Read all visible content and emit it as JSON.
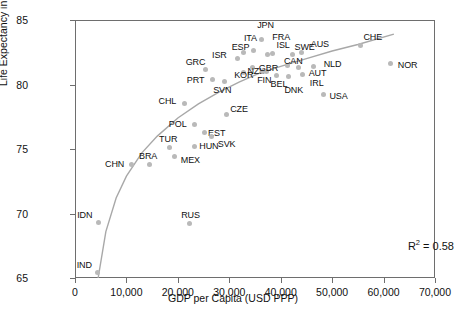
{
  "chart_data": {
    "type": "scatter",
    "title": "",
    "xlabel": "GDP per Capita (USD PPP)",
    "ylabel": "Life Expectancy in Years",
    "xlim": [
      0,
      70000
    ],
    "ylim": [
      65,
      85
    ],
    "xticks": [
      "0",
      "10,000",
      "20,000",
      "30,000",
      "40,000",
      "50,000",
      "60,000",
      "70,000"
    ],
    "xtick_values": [
      0,
      10000,
      20000,
      30000,
      40000,
      50000,
      60000,
      70000
    ],
    "yticks": [
      "65",
      "70",
      "75",
      "80",
      "85"
    ],
    "ytick_values": [
      65,
      70,
      75,
      80,
      85
    ],
    "grid": false,
    "legend": "none",
    "annotation": "R2 = 0.58",
    "annotation_r2": "0.58",
    "trendline": {
      "type": "logarithmic",
      "color": "#a8a8a8",
      "points": [
        [
          4500,
          65.0
        ],
        [
          6000,
          68.6
        ],
        [
          8000,
          71.2
        ],
        [
          10000,
          72.9
        ],
        [
          13000,
          74.7
        ],
        [
          16000,
          76.0
        ],
        [
          20000,
          77.4
        ],
        [
          24000,
          78.5
        ],
        [
          28000,
          79.4
        ],
        [
          32000,
          80.2
        ],
        [
          36000,
          80.9
        ],
        [
          40000,
          81.4
        ],
        [
          45000,
          82.0
        ],
        [
          50000,
          82.6
        ],
        [
          55000,
          83.1
        ],
        [
          62000,
          83.9
        ]
      ]
    },
    "marker_color": "#b9b9b9",
    "points": [
      {
        "label": "IND",
        "x": 4400,
        "y": 65.4,
        "lx": -21,
        "ly": -12
      },
      {
        "label": "IDN",
        "x": 4500,
        "y": 69.3,
        "lx": -21,
        "ly": -12
      },
      {
        "label": "CHN",
        "x": 10900,
        "y": 73.8,
        "lx": -26,
        "ly": -4
      },
      {
        "label": "BRA",
        "x": 14400,
        "y": 73.8,
        "lx": -10,
        "ly": -12
      },
      {
        "label": "TUR",
        "x": 18300,
        "y": 75.1,
        "lx": -10,
        "ly": -13
      },
      {
        "label": "MEX",
        "x": 19400,
        "y": 74.4,
        "lx": 6,
        "ly": -1
      },
      {
        "label": "RUS",
        "x": 22200,
        "y": 69.2,
        "lx": -8,
        "ly": -13
      },
      {
        "label": "HUN",
        "x": 23200,
        "y": 75.2,
        "lx": 5,
        "ly": -4
      },
      {
        "label": "POL",
        "x": 23300,
        "y": 76.9,
        "lx": -26,
        "ly": -4
      },
      {
        "label": "EST",
        "x": 25100,
        "y": 76.3,
        "lx": 4,
        "ly": -3
      },
      {
        "label": "SVK",
        "x": 26600,
        "y": 76.0,
        "lx": 6,
        "ly": 4
      },
      {
        "label": "CHL",
        "x": 21300,
        "y": 78.5,
        "lx": -26,
        "ly": -7
      },
      {
        "label": "CZE",
        "x": 29400,
        "y": 77.7,
        "lx": 4,
        "ly": -9
      },
      {
        "label": "PRT",
        "x": 26800,
        "y": 80.4,
        "lx": -26,
        "ly": -3
      },
      {
        "label": "GRC",
        "x": 25400,
        "y": 81.2,
        "lx": -20,
        "ly": -11
      },
      {
        "label": "SVN",
        "x": 29000,
        "y": 80.2,
        "lx": -11,
        "ly": 4
      },
      {
        "label": "KOR",
        "x": 32700,
        "y": 80.9,
        "lx": -9,
        "ly": -2
      },
      {
        "label": "ISR",
        "x": 31500,
        "y": 82.0,
        "lx": -25,
        "ly": -8
      },
      {
        "label": "ESP",
        "x": 32800,
        "y": 82.5,
        "lx": -12,
        "ly": -9
      },
      {
        "label": "ITA",
        "x": 34800,
        "y": 82.6,
        "lx": -10,
        "ly": -17
      },
      {
        "label": "NZL",
        "x": 34500,
        "y": 81.3,
        "lx": -5,
        "ly": -1
      },
      {
        "label": "FIN",
        "x": 36400,
        "y": 81.0,
        "lx": -5,
        "ly": 4
      },
      {
        "label": "JPN",
        "x": 36200,
        "y": 83.5,
        "lx": -4,
        "ly": -18
      },
      {
        "label": "FRA",
        "x": 37400,
        "y": 82.3,
        "lx": 5,
        "ly": -22
      },
      {
        "label": "ISL",
        "x": 38400,
        "y": 82.4,
        "lx": 4,
        "ly": -13
      },
      {
        "label": "GBR",
        "x": 37300,
        "y": 81.0,
        "lx": -8,
        "ly": -8
      },
      {
        "label": "BEL",
        "x": 39200,
        "y": 80.7,
        "lx": -6,
        "ly": 5
      },
      {
        "label": "CAN",
        "x": 41400,
        "y": 81.5,
        "lx": -4,
        "ly": -8
      },
      {
        "label": "SWE",
        "x": 42300,
        "y": 82.3,
        "lx": 2,
        "ly": -12
      },
      {
        "label": "DNK",
        "x": 41500,
        "y": 80.6,
        "lx": -4,
        "ly": 9
      },
      {
        "label": "AUT",
        "x": 43500,
        "y": 81.3,
        "lx": 10,
        "ly": 1
      },
      {
        "label": "AUS",
        "x": 44100,
        "y": 82.5,
        "lx": 9,
        "ly": -12
      },
      {
        "label": "IRL",
        "x": 44300,
        "y": 80.8,
        "lx": 7,
        "ly": 5
      },
      {
        "label": "NLD",
        "x": 46400,
        "y": 81.4,
        "lx": 10,
        "ly": -6
      },
      {
        "label": "USA",
        "x": 48300,
        "y": 79.2,
        "lx": 6,
        "ly": -3
      },
      {
        "label": "CHE",
        "x": 55500,
        "y": 83.0,
        "lx": 3,
        "ly": -13
      },
      {
        "label": "NOR",
        "x": 61400,
        "y": 81.6,
        "lx": 7,
        "ly": -3
      }
    ]
  }
}
